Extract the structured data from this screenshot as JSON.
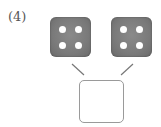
{
  "problem": {
    "number_label": "(4)"
  },
  "dice": [
    {
      "value": 4,
      "pips": 4
    },
    {
      "value": 4,
      "pips": 4
    }
  ],
  "answer_box": {
    "value": ""
  },
  "colors": {
    "die_fill": "#7a7a7a",
    "pip": "#ffffff",
    "line": "#777777",
    "box_border": "#9a9a9a"
  }
}
